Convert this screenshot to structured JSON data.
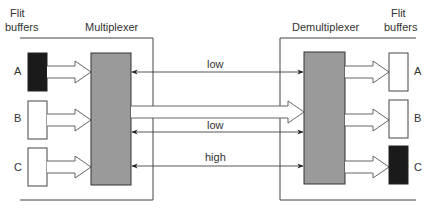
{
  "diagram": {
    "left": {
      "buffers_title_line1": "Flit",
      "buffers_title_line2": "buffers",
      "unit_title": "Multiplexer",
      "buffers": [
        {
          "label": "A",
          "state": "full"
        },
        {
          "label": "B",
          "state": "empty"
        },
        {
          "label": "C",
          "state": "empty"
        }
      ]
    },
    "right": {
      "buffers_title_line1": "Flit",
      "buffers_title_line2": "buffers",
      "unit_title": "Demultiplexer",
      "buffers": [
        {
          "label": "A",
          "state": "empty"
        },
        {
          "label": "B",
          "state": "empty"
        },
        {
          "label": "C",
          "state": "full"
        }
      ]
    },
    "links": [
      {
        "label": "low",
        "type": "credit"
      },
      {
        "label": "",
        "type": "data"
      },
      {
        "label": "low",
        "type": "credit"
      },
      {
        "label": "high",
        "type": "credit"
      }
    ],
    "colors": {
      "full_buffer": "#1a1a1a",
      "unit_fill": "#9a9a9a",
      "line": "#444444"
    }
  }
}
